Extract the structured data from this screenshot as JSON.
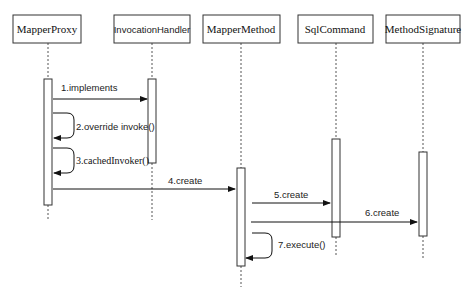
{
  "diagram": {
    "type": "sequence",
    "participants": [
      {
        "id": "mapper-proxy",
        "label": "MapperProxy"
      },
      {
        "id": "invocation-handler",
        "label": "InvocationHandler"
      },
      {
        "id": "mapper-method",
        "label": "MapperMethod"
      },
      {
        "id": "sql-command",
        "label": "SqlCommand"
      },
      {
        "id": "method-signature",
        "label": "MethodSignature"
      }
    ],
    "messages": [
      {
        "step": 1,
        "from": "MapperProxy",
        "to": "InvocationHandler",
        "label": "1.implements"
      },
      {
        "step": 2,
        "from": "MapperProxy",
        "to": "MapperProxy",
        "label": "2.override invoke()"
      },
      {
        "step": 3,
        "from": "MapperProxy",
        "to": "MapperProxy",
        "label": "3.cachedInvoker()"
      },
      {
        "step": 4,
        "from": "MapperProxy",
        "to": "MapperMethod",
        "label": "4.create"
      },
      {
        "step": 5,
        "from": "MapperMethod",
        "to": "SqlCommand",
        "label": "5.create"
      },
      {
        "step": 6,
        "from": "MapperMethod",
        "to": "MethodSignature",
        "label": "6.create"
      },
      {
        "step": 7,
        "from": "MapperMethod",
        "to": "MapperMethod",
        "label": "7.execute()"
      }
    ]
  }
}
